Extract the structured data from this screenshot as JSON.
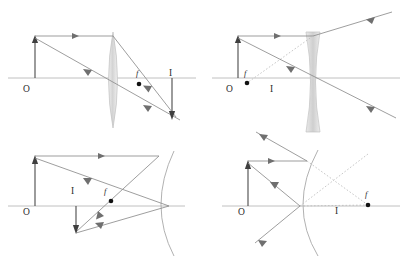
{
  "figure": {
    "background_color": "#ffffff",
    "width": 405,
    "height": 259,
    "panel_count": 4
  },
  "colors": {
    "axis": "#b9b9b9",
    "ray": "#8c8c8c",
    "ray_dark": "#6e6e6e",
    "virtual_ray": "#bdbdbd",
    "arrow": "#4a4a4a",
    "arrowhead": "#3f3f3f",
    "mirror": "#a8a8a8",
    "lens_fill_light": "#eeeeee",
    "lens_fill_mid": "#d8d8d8",
    "focal_dot": "#121212",
    "label_text": "#2b2b2b"
  },
  "panels": [
    {
      "id": "panel-converging-lens",
      "name": "converging-lens",
      "element_type": "biconvex-lens",
      "image_type": "real-inverted",
      "labels": {
        "origin": "O",
        "focal_point": "f",
        "image": "I"
      },
      "label_positions": {
        "origin": {
          "x": 23,
          "y": 92
        },
        "focal_point": {
          "x": 139,
          "y": 76
        },
        "image": {
          "x": 167,
          "y": 76
        }
      },
      "focal_dot": {
        "x": 139,
        "y": 84
      },
      "axis": {
        "x1": 8,
        "y1": 78,
        "x2": 195,
        "y2": 78
      },
      "object": {
        "x": 35,
        "base_y": 78,
        "tip_y": 36,
        "direction": "up"
      },
      "image_arrow": {
        "x": 172,
        "base_y": 78,
        "tip_y": 118,
        "direction": "down"
      },
      "lens": {
        "center_x": 113,
        "top_y": 32,
        "bottom_y": 128
      }
    },
    {
      "id": "panel-diverging-lens",
      "name": "diverging-lens",
      "element_type": "biconcave-lens",
      "image_type": "virtual-upright",
      "labels": {
        "origin": "O",
        "focal_point": "f",
        "image": "I"
      },
      "label_positions": {
        "origin": {
          "x": 226,
          "y": 92
        },
        "focal_point": {
          "x": 246,
          "y": 75
        },
        "image": {
          "x": 272,
          "y": 92
        }
      },
      "focal_dot": {
        "x": 247,
        "y": 83
      },
      "axis": {
        "x1": 208,
        "y1": 78,
        "x2": 400,
        "y2": 78
      },
      "object": {
        "x": 238,
        "base_y": 78,
        "tip_y": 36,
        "direction": "up"
      },
      "lens": {
        "center_x": 313,
        "top_y": 32,
        "bottom_y": 132
      }
    },
    {
      "id": "panel-concave-mirror",
      "name": "concave-mirror",
      "element_type": "concave-mirror",
      "image_type": "real-inverted",
      "labels": {
        "origin": "O",
        "focal_point": "f",
        "image": "I"
      },
      "label_positions": {
        "origin": {
          "x": 23,
          "y": 215
        },
        "focal_point": {
          "x": 106,
          "y": 194
        },
        "image": {
          "x": 73,
          "y": 193
        }
      },
      "focal_dot": {
        "x": 111,
        "y": 201
      },
      "axis": {
        "x1": 8,
        "y1": 206,
        "x2": 195,
        "y2": 206
      },
      "object": {
        "x": 35,
        "base_y": 206,
        "tip_y": 155,
        "direction": "up"
      },
      "image_arrow": {
        "x": 76,
        "base_y": 206,
        "tip_y": 231,
        "direction": "down"
      },
      "mirror": {
        "vertex_x": 169,
        "axis_y": 206,
        "top_y": 151,
        "bottom_y": 255
      }
    },
    {
      "id": "panel-convex-mirror",
      "name": "convex-mirror",
      "element_type": "convex-mirror",
      "image_type": "virtual-upright",
      "labels": {
        "origin": "O",
        "focal_point": "f",
        "image": "I"
      },
      "label_positions": {
        "origin": {
          "x": 238,
          "y": 215
        },
        "focal_point": {
          "x": 365,
          "y": 196
        },
        "image": {
          "x": 337,
          "y": 213
        }
      },
      "focal_dot": {
        "x": 368,
        "y": 205
      },
      "axis": {
        "x1": 222,
        "y1": 206,
        "x2": 400,
        "y2": 206
      },
      "object": {
        "x": 248,
        "base_y": 206,
        "tip_y": 160,
        "direction": "up"
      },
      "mirror": {
        "vertex_x": 300,
        "axis_y": 206,
        "top_y": 150,
        "bottom_y": 255
      }
    }
  ],
  "legend_notes": {
    "solid_rays": "real light rays",
    "dotted_rays": "virtual ray extensions",
    "arrowheads": "direction of propagation"
  }
}
